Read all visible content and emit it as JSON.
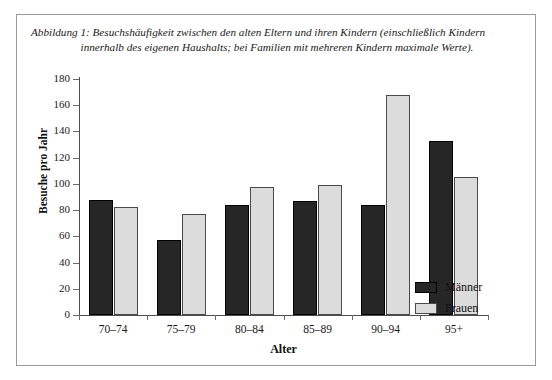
{
  "figure": {
    "caption_line1": "Abbildung 1: Besuchshäufigkeit zwischen den alten Eltern und ihren Kindern (einschließlich Kindern",
    "caption_line2": "innerhalb des eigenen Haushalts; bei Familien mit mehreren Kindern maximale Werte)."
  },
  "chart_data": {
    "type": "bar",
    "title": "",
    "categories": [
      "70–74",
      "75–79",
      "80–84",
      "85–89",
      "90–94",
      "95+"
    ],
    "series": [
      {
        "name": "Männer",
        "color": "#262626",
        "values": [
          88,
          57,
          84,
          87,
          84,
          133
        ]
      },
      {
        "name": "Frauen",
        "color": "#dcdcdc",
        "values": [
          82,
          77,
          98,
          99,
          168,
          105
        ]
      }
    ],
    "xlabel": "Alter",
    "ylabel": "Besuche pro Jahr",
    "ylim": [
      0,
      180
    ],
    "yticks": [
      0,
      20,
      40,
      60,
      80,
      100,
      120,
      140,
      160,
      180
    ],
    "ytick_labels": [
      "0",
      "20",
      "40",
      "60",
      "80",
      "100",
      "120",
      "140",
      "160",
      "180"
    ],
    "grid": false,
    "legend_position": "bottom-right"
  }
}
